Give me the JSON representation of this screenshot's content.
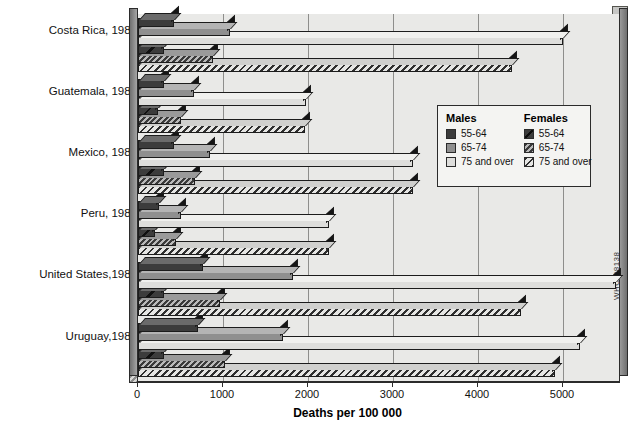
{
  "chart_data": {
    "type": "bar",
    "orientation": "horizontal",
    "title": "",
    "xlabel": "Deaths per 100 000",
    "ylabel": "",
    "xlim": [
      0,
      5700
    ],
    "ticks": [
      0,
      1000,
      2000,
      3000,
      4000,
      5000
    ],
    "tick_labels": [
      "0",
      "1000",
      "2000",
      "3000",
      "4000",
      "5000"
    ],
    "grid": true,
    "legend_position": "center-right",
    "categories": [
      "Costa Rica, 1983",
      "Guatemala, 1981",
      "Mexico, 1982",
      "Peru, 1982",
      "United States,1982",
      "Uruguay,1984"
    ],
    "series": [
      {
        "name": "Males 55-64",
        "sex": "Males",
        "age": "55-64",
        "values": [
          420,
          300,
          420,
          250,
          760,
          700
        ]
      },
      {
        "name": "Males 65-74",
        "sex": "Males",
        "age": "65-74",
        "values": [
          1080,
          660,
          850,
          510,
          1820,
          1700
        ]
      },
      {
        "name": "Males 75 and over",
        "sex": "Males",
        "age": "75 and over",
        "values": [
          5000,
          1980,
          3230,
          2250,
          5700,
          5200
        ]
      },
      {
        "name": "Females 55-64",
        "sex": "Females",
        "age": "55-64",
        "values": [
          300,
          230,
          300,
          200,
          300,
          300
        ]
      },
      {
        "name": "Females 65-74",
        "sex": "Females",
        "age": "65-74",
        "values": [
          880,
          500,
          670,
          450,
          960,
          1020
        ]
      },
      {
        "name": "Females 75 and over",
        "sex": "Females",
        "age": "75 and over",
        "values": [
          4400,
          1960,
          3230,
          2250,
          4500,
          4900
        ]
      }
    ]
  },
  "axis": {
    "x_label": "Deaths per 100 000",
    "tick_labels": [
      "0",
      "1000",
      "2000",
      "3000",
      "4000",
      "5000"
    ]
  },
  "categories": [
    {
      "label": "Costa Rica, 1983"
    },
    {
      "label": "Guatemala, 1981"
    },
    {
      "label": "Mexico, 1982"
    },
    {
      "label": "Peru, 1982"
    },
    {
      "label": "United States,1982"
    },
    {
      "label": "Uruguay,1984"
    }
  ],
  "legend": {
    "males": {
      "heading": "Males",
      "items": [
        {
          "label": "55-64",
          "swatch": "males-55-64-swatch"
        },
        {
          "label": "65-74",
          "swatch": "males-65-74-swatch"
        },
        {
          "label": "75 and over",
          "swatch": "males-75-over-swatch"
        }
      ]
    },
    "females": {
      "heading": "Females",
      "items": [
        {
          "label": "55-64",
          "swatch": "females-55-64-swatch"
        },
        {
          "label": "65-74",
          "swatch": "females-65-74-swatch"
        },
        {
          "label": "75 and over",
          "swatch": "females-75-over-swatch"
        }
      ]
    }
  },
  "credit": "WHO 88138",
  "colors": {
    "dark": "#3c3c3c",
    "mid": "#8f8f8f",
    "light": "#dededc",
    "plot_background": "#e9e9e7",
    "axis": "#2b2b2b",
    "gridline": "#8e8e8c"
  }
}
